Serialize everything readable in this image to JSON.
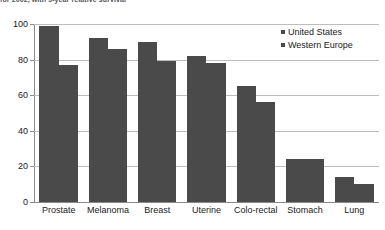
{
  "caption": {
    "text": "for 2002, with 5-year relative survival"
  },
  "chart_data": {
    "type": "bar",
    "title": "",
    "xlabel": "",
    "ylabel": "",
    "ylim": [
      0,
      100
    ],
    "yticks": [
      0,
      20,
      40,
      60,
      80,
      100
    ],
    "grid": true,
    "legend_position": "top-right",
    "categories": [
      "Prostate",
      "Melanoma",
      "Breast",
      "Uterine",
      "Colo-rectal",
      "Stomach",
      "Lung"
    ],
    "series": [
      {
        "name": "United States",
        "values": [
          99,
          92,
          90,
          82,
          65,
          24,
          14
        ]
      },
      {
        "name": "Western Europe",
        "values": [
          77,
          86,
          79,
          78,
          56,
          24,
          10
        ]
      }
    ],
    "colors": {
      "bar": "#4a4a4a",
      "gridline": "#bdbdbd",
      "axis": "#8a8a8a",
      "background": "#ffffff"
    }
  }
}
